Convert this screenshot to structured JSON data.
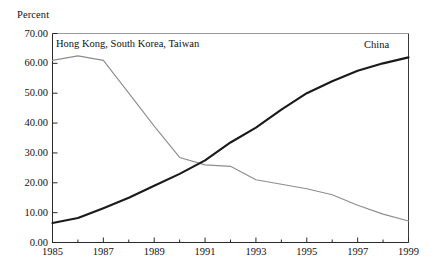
{
  "chart_data": {
    "type": "line",
    "title": "",
    "ylabel": "Percent",
    "xlabel": "",
    "ylim": [
      0,
      70
    ],
    "xlim": [
      1985,
      1999
    ],
    "grid": false,
    "legend_position": "inline-annotations",
    "yticks": [
      "0.00",
      "10.00",
      "20.00",
      "30.00",
      "40.00",
      "50.00",
      "60.00",
      "70.00"
    ],
    "ytick_values": [
      0,
      10,
      20,
      30,
      40,
      50,
      60,
      70
    ],
    "xticks": [
      "1985",
      "1987",
      "1989",
      "1991",
      "1993",
      "1995",
      "1997",
      "1999"
    ],
    "xtick_values": [
      1985,
      1987,
      1989,
      1991,
      1993,
      1995,
      1997,
      1999
    ],
    "x": [
      1985,
      1986,
      1987,
      1988,
      1989,
      1990,
      1991,
      1992,
      1993,
      1994,
      1995,
      1996,
      1997,
      1998,
      1999
    ],
    "series": [
      {
        "name": "China",
        "color": "#1a1a1a",
        "width": 2.1,
        "label_text": "China",
        "values": [
          6.5,
          8.2,
          11.5,
          15.0,
          19.0,
          23.0,
          27.5,
          33.5,
          38.5,
          44.5,
          50.0,
          54.0,
          57.5,
          60.0,
          62.0
        ]
      },
      {
        "name": "Hong Kong, South Korea, Taiwan",
        "color": "#8d8d8d",
        "width": 1.1,
        "label_text": "Hong Kong, South Korea, Taiwan",
        "values": [
          61.0,
          62.5,
          61.0,
          50.0,
          39.0,
          28.5,
          26.0,
          25.5,
          21.0,
          19.5,
          18.0,
          16.0,
          12.5,
          9.5,
          7.2
        ]
      }
    ],
    "annotations": [
      {
        "text": "China",
        "x": 1998.0,
        "y": 66.5
      },
      {
        "text": "Hong Kong, South Korea, Taiwan",
        "x": 1985.2,
        "y": 67.5
      }
    ]
  }
}
